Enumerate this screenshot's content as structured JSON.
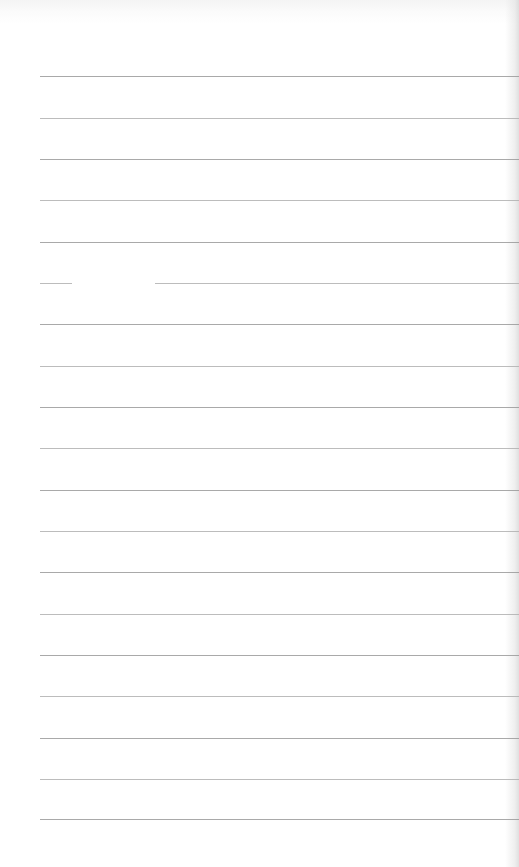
{
  "page": {
    "type": "lined-paper",
    "background_color": "#ffffff",
    "line_color": "#9a9a9a",
    "line_count": 19,
    "line_left_x": 40,
    "first_line_y": 76,
    "line_spacing": 41.3,
    "line_positions_y": [
      76,
      118,
      159,
      200,
      242,
      283,
      324,
      366,
      407,
      448,
      490,
      531,
      572,
      614,
      655,
      696,
      738,
      779,
      819
    ],
    "gaps": [
      {
        "line_index": 5,
        "x_start": 72,
        "x_end": 155
      }
    ],
    "text": ""
  }
}
